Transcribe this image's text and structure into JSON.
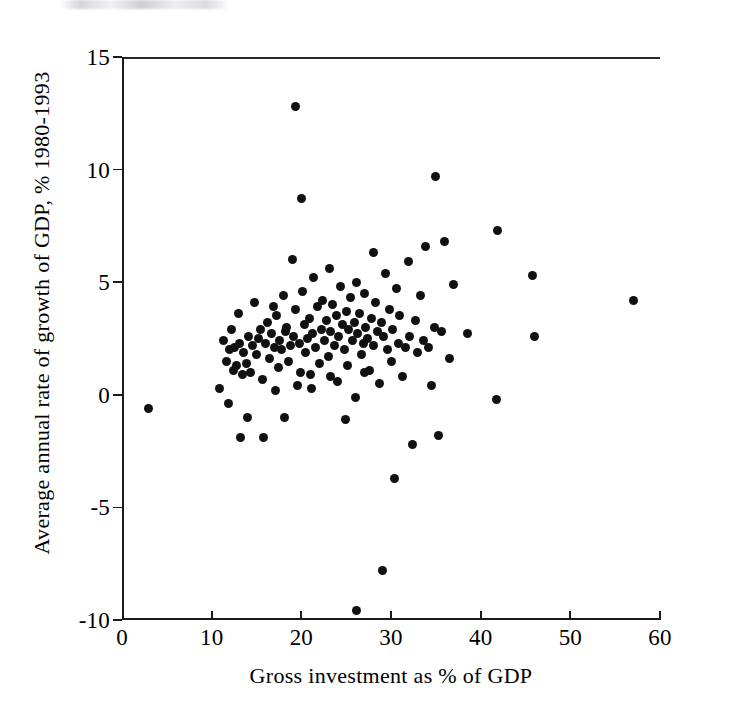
{
  "figure": {
    "background_color": "#ffffff",
    "ink_color": "#111111"
  },
  "chart_data": {
    "type": "scatter",
    "title": "",
    "subtitle": "",
    "xlabel": "Gross investment as % of GDP",
    "ylabel": "Average annual rate of growth of GDP, % 1980-1993",
    "xlim": [
      0,
      60
    ],
    "ylim": [
      -10,
      15
    ],
    "xticks": [
      0,
      10,
      20,
      30,
      40,
      50,
      60
    ],
    "xticklabels": [
      "0",
      "10",
      "20",
      "30",
      "40",
      "50",
      "60"
    ],
    "yticks": [
      -10,
      -5,
      0,
      5,
      10,
      15
    ],
    "yticklabels": [
      "-10",
      "-5",
      "0",
      "5",
      "10",
      "15"
    ],
    "grid": false,
    "legend": null,
    "annotations": [],
    "reference_lines": [
      {
        "axis": "y",
        "value": 0,
        "style": "solid"
      }
    ],
    "marker": {
      "shape": "circle",
      "color": "#111111",
      "size": 9
    },
    "points": [
      [
        3.0,
        -0.6
      ],
      [
        10.9,
        0.3
      ],
      [
        11.3,
        2.4
      ],
      [
        11.6,
        1.5
      ],
      [
        11.9,
        -0.4
      ],
      [
        12.0,
        2.0
      ],
      [
        12.4,
        1.1
      ],
      [
        12.6,
        2.1
      ],
      [
        12.8,
        1.3
      ],
      [
        13.0,
        3.6
      ],
      [
        13.2,
        -1.9
      ],
      [
        13.4,
        0.9
      ],
      [
        13.6,
        1.9
      ],
      [
        13.9,
        1.4
      ],
      [
        14.1,
        2.6
      ],
      [
        14.3,
        1.0
      ],
      [
        14.6,
        2.2
      ],
      [
        14.8,
        4.1
      ],
      [
        15.0,
        1.8
      ],
      [
        15.2,
        2.5
      ],
      [
        15.5,
        2.9
      ],
      [
        15.7,
        0.7
      ],
      [
        16.0,
        2.3
      ],
      [
        16.2,
        3.2
      ],
      [
        16.5,
        1.6
      ],
      [
        16.7,
        2.7
      ],
      [
        17.0,
        2.1
      ],
      [
        17.2,
        3.5
      ],
      [
        17.4,
        1.2
      ],
      [
        17.6,
        2.4
      ],
      [
        17.8,
        2.0
      ],
      [
        18.0,
        4.4
      ],
      [
        18.2,
        2.8
      ],
      [
        18.4,
        3.0
      ],
      [
        18.6,
        1.5
      ],
      [
        18.8,
        2.2
      ],
      [
        19.0,
        6.0
      ],
      [
        19.1,
        2.6
      ],
      [
        19.3,
        12.8
      ],
      [
        19.4,
        3.8
      ],
      [
        19.6,
        0.4
      ],
      [
        19.8,
        2.3
      ],
      [
        20.0,
        8.7
      ],
      [
        20.1,
        4.6
      ],
      [
        20.3,
        3.1
      ],
      [
        20.5,
        1.9
      ],
      [
        20.7,
        2.5
      ],
      [
        20.9,
        3.4
      ],
      [
        21.0,
        0.9
      ],
      [
        21.2,
        2.7
      ],
      [
        21.4,
        5.2
      ],
      [
        21.6,
        2.1
      ],
      [
        21.8,
        3.9
      ],
      [
        22.0,
        1.4
      ],
      [
        22.2,
        2.9
      ],
      [
        22.4,
        4.2
      ],
      [
        22.6,
        2.4
      ],
      [
        22.8,
        3.3
      ],
      [
        23.0,
        1.7
      ],
      [
        23.1,
        5.6
      ],
      [
        23.3,
        2.8
      ],
      [
        23.5,
        4.0
      ],
      [
        23.7,
        2.2
      ],
      [
        23.9,
        3.5
      ],
      [
        24.0,
        0.6
      ],
      [
        24.2,
        2.6
      ],
      [
        24.4,
        4.8
      ],
      [
        24.6,
        3.1
      ],
      [
        24.8,
        2.0
      ],
      [
        25.0,
        3.7
      ],
      [
        25.1,
        1.3
      ],
      [
        25.3,
        2.9
      ],
      [
        25.5,
        4.3
      ],
      [
        25.7,
        2.4
      ],
      [
        25.9,
        3.2
      ],
      [
        26.0,
        -0.1
      ],
      [
        26.1,
        5.0
      ],
      [
        26.3,
        2.7
      ],
      [
        26.5,
        3.6
      ],
      [
        26.7,
        1.8
      ],
      [
        26.9,
        2.3
      ],
      [
        27.0,
        4.5
      ],
      [
        27.2,
        3.0
      ],
      [
        27.4,
        2.5
      ],
      [
        27.6,
        1.1
      ],
      [
        27.8,
        3.4
      ],
      [
        28.0,
        6.3
      ],
      [
        28.1,
        2.2
      ],
      [
        28.3,
        4.1
      ],
      [
        28.5,
        2.8
      ],
      [
        28.7,
        0.5
      ],
      [
        28.9,
        3.2
      ],
      [
        29.0,
        -7.8
      ],
      [
        29.2,
        2.6
      ],
      [
        29.4,
        5.4
      ],
      [
        29.6,
        2.0
      ],
      [
        29.8,
        3.8
      ],
      [
        30.0,
        1.5
      ],
      [
        30.2,
        2.9
      ],
      [
        30.4,
        -3.7
      ],
      [
        30.6,
        4.7
      ],
      [
        30.8,
        2.3
      ],
      [
        31.0,
        3.5
      ],
      [
        31.3,
        0.8
      ],
      [
        31.6,
        2.1
      ],
      [
        31.9,
        5.9
      ],
      [
        32.1,
        2.6
      ],
      [
        32.4,
        -2.2
      ],
      [
        32.7,
        3.3
      ],
      [
        33.0,
        1.9
      ],
      [
        33.3,
        4.4
      ],
      [
        33.6,
        2.4
      ],
      [
        33.9,
        6.6
      ],
      [
        34.2,
        2.1
      ],
      [
        34.5,
        0.4
      ],
      [
        34.8,
        3.0
      ],
      [
        35.0,
        9.7
      ],
      [
        35.3,
        -1.8
      ],
      [
        35.6,
        2.8
      ],
      [
        36.0,
        6.8
      ],
      [
        36.5,
        1.6
      ],
      [
        37.0,
        4.9
      ],
      [
        38.5,
        2.7
      ],
      [
        41.8,
        -0.2
      ],
      [
        41.9,
        7.3
      ],
      [
        26.2,
        -9.6
      ],
      [
        45.8,
        5.3
      ],
      [
        46.0,
        2.6
      ],
      [
        57.0,
        4.2
      ],
      [
        17.1,
        0.2
      ],
      [
        18.1,
        -1.0
      ],
      [
        14.0,
        -1.0
      ],
      [
        15.8,
        -1.9
      ],
      [
        19.9,
        1.0
      ],
      [
        21.1,
        0.3
      ],
      [
        23.2,
        0.8
      ],
      [
        24.9,
        -1.1
      ],
      [
        27.1,
        1.0
      ],
      [
        12.2,
        2.9
      ],
      [
        13.1,
        2.3
      ],
      [
        16.9,
        3.9
      ]
    ]
  }
}
